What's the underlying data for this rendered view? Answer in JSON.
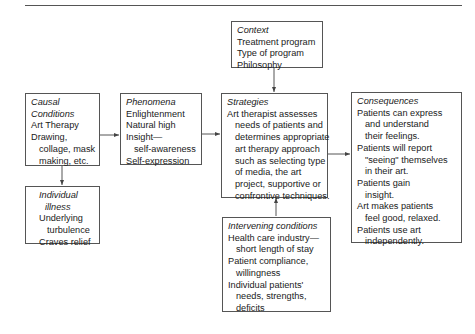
{
  "diagram": {
    "context": {
      "title": "Context",
      "lines": [
        "Treatment program",
        "Type of program",
        "Philosophy"
      ]
    },
    "causal_conditions": {
      "title_line1": "Causal",
      "title_line2": "Conditions",
      "lines": [
        "Art Therapy",
        "Drawing,",
        "collage, mask",
        "making, etc."
      ]
    },
    "individual_illness": {
      "title_line1": "Individual",
      "title_line2": "illness",
      "lines": [
        "Underlying",
        "turbulence",
        "Craves relief"
      ]
    },
    "phenomena": {
      "title": "Phenomena",
      "lines": [
        "Enlightenment",
        "Natural high",
        "Insight—",
        "self-awareness",
        "Self-expression"
      ]
    },
    "strategies": {
      "title": "Strategies",
      "lines": [
        "Art therapist assesses",
        "needs of patients and",
        "determines appropriate",
        "art therapy approach",
        "such as selecting type",
        "of media, the art",
        "project, supportive or",
        "confrontive techniques."
      ]
    },
    "intervening_conditions": {
      "title": "Intervening conditions",
      "lines": [
        "Health care industry—",
        "short length of stay",
        "Patient compliance,",
        "willingness",
        "Individual patients'",
        "needs, strengths,",
        "deficits"
      ]
    },
    "consequences": {
      "title": "Consequences",
      "lines": [
        "Patients can express",
        "and understand",
        "their feelings.",
        "Patients will report",
        "\"seeing\" themselves",
        "in their art.",
        "Patients gain",
        "insight.",
        "Art makes patients",
        "feel good, relaxed.",
        "Patients use art",
        "independently."
      ]
    }
  }
}
